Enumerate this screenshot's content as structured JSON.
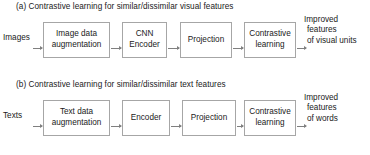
{
  "figure": {
    "background_color": "#ffffff",
    "box_border_color": "#a6a6a6",
    "arrow_color": "#7f7f7f",
    "text_color": "#1a1a1a"
  },
  "panels": [
    {
      "id": "a",
      "caption": "(a) Contrastive learning for similar/dissimilar visual features",
      "input_label": "Images",
      "nodes": [
        {
          "line1": "Image data",
          "line2": "augmentation"
        },
        {
          "line1": "CNN",
          "line2": "Encoder"
        },
        {
          "line1": "Projection",
          "line2": ""
        },
        {
          "line1": "Contrastive",
          "line2": "learning"
        }
      ],
      "output": {
        "line1": "Improved",
        "line2": "features",
        "line3": "of visual units"
      }
    },
    {
      "id": "b",
      "caption": "(b) Contrastive learning for similar/dissimilar text features",
      "input_label": "Texts",
      "nodes": [
        {
          "line1": "Text data",
          "line2": "augmentation"
        },
        {
          "line1": "Encoder",
          "line2": ""
        },
        {
          "line1": "Projection",
          "line2": ""
        },
        {
          "line1": "Contrastive",
          "line2": "learning"
        }
      ],
      "output": {
        "line1": "Improved",
        "line2": "features",
        "line3": "of words"
      }
    }
  ]
}
